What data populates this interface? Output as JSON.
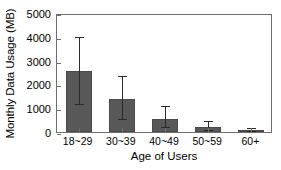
{
  "chart_data": {
    "type": "bar",
    "title": "",
    "xlabel": "Age of Users",
    "ylabel": "Monthly Data Usage (MB)",
    "categories": [
      "18~29",
      "30~39",
      "40~49",
      "50~59",
      "60+"
    ],
    "values": [
      2580,
      1400,
      550,
      210,
      80
    ],
    "error_low": [
      1130,
      500,
      170,
      60,
      20
    ],
    "error_high": [
      3950,
      2300,
      1050,
      420,
      140
    ],
    "ylim": [
      0,
      5000
    ],
    "yticks": [
      0,
      1000,
      2000,
      3000,
      4000,
      5000
    ],
    "ytick_labels": [
      "0",
      "1000",
      "2000",
      "3000",
      "4000",
      "5000"
    ],
    "grid": false,
    "legend": null,
    "bar_color": "#585858",
    "error_color": "#2b2b2b",
    "axis_color": "#6e6e6e",
    "background": "#ffffff"
  }
}
